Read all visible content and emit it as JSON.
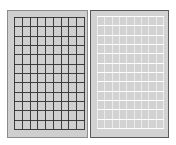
{
  "figure": {
    "panels": [
      {
        "id": "dark-grid",
        "background": "#cfcfcf",
        "line_color": "#2e2e2e",
        "columns": 10,
        "rows": 13
      },
      {
        "id": "light-grid",
        "background": "#d2d2d2",
        "line_color": "#ffffff",
        "columns": 10,
        "rows": 13
      }
    ]
  }
}
